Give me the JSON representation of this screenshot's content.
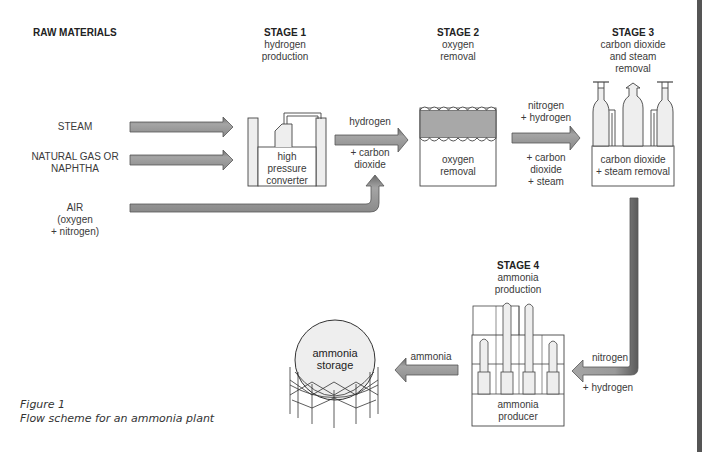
{
  "header": {
    "raw_materials": "RAW MATERIALS"
  },
  "raw_materials": [
    {
      "label": "STEAM"
    },
    {
      "label": "NATURAL GAS OR",
      "label2": "NAPHTHA"
    },
    {
      "label": "AIR",
      "label2": "(oxygen",
      "label3": "+ nitrogen)"
    }
  ],
  "stages": [
    {
      "title": "STAGE 1",
      "line1": "hydrogen",
      "line2": "production",
      "box": [
        "high",
        "pressure",
        "converter"
      ]
    },
    {
      "title": "STAGE 2",
      "line1": "oxygen",
      "line2": "removal",
      "box": [
        "oxygen",
        "removal"
      ]
    },
    {
      "title": "STAGE 3",
      "line1": "carbon dioxide",
      "line2": "and steam",
      "line3": "removal",
      "box": [
        "carbon dioxide",
        "+ steam removal"
      ]
    },
    {
      "title": "STAGE 4",
      "line1": "ammonia",
      "line2": "production",
      "box": [
        "ammonia",
        "producer"
      ]
    }
  ],
  "flows": {
    "s1_out_top": "hydrogen",
    "s1_out_bottom1": "+ carbon",
    "s1_out_bottom2": "dioxide",
    "s2_out_top1": "nitrogen",
    "s2_out_top2": "+ hydrogen",
    "s2_out_bottom1": "+ carbon",
    "s2_out_bottom2": "dioxide",
    "s2_out_bottom3": "+ steam",
    "s3_out_top": "nitrogen",
    "s3_out_bottom": "+ hydrogen",
    "s4_out": "ammonia"
  },
  "storage": {
    "line1": "ammonia",
    "line2": "storage"
  },
  "caption": {
    "line1": "Figure 1",
    "line2": "Flow scheme for an ammonia plant"
  },
  "colors": {
    "arrow_fill": "#9a9a9a",
    "arrow_dark": "#555555",
    "vessel_fill": "#e8e8e8",
    "band_fill": "#9c9c9c",
    "line": "#333333"
  }
}
